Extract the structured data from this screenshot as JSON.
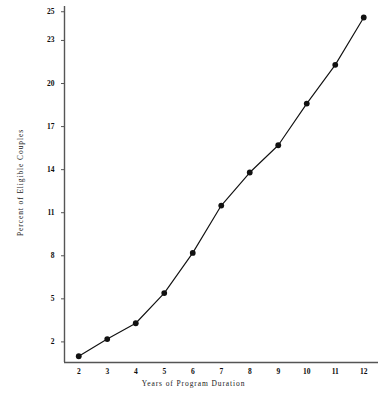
{
  "chart_data": {
    "type": "line",
    "title": "",
    "xlabel": "Years of Program Duration",
    "ylabel": "Percent of Eligible Couples",
    "x": [
      2,
      3,
      4,
      5,
      6,
      7,
      8,
      9,
      10,
      11,
      12
    ],
    "values": [
      1.0,
      2.2,
      3.3,
      5.4,
      8.2,
      11.5,
      13.8,
      15.7,
      18.6,
      21.3,
      24.6
    ],
    "series": [
      {
        "name": "Percent of Eligible Couples",
        "values": [
          1.0,
          2.2,
          3.3,
          5.4,
          8.2,
          11.5,
          13.8,
          15.7,
          18.6,
          21.3,
          24.6
        ]
      }
    ],
    "xticks": [
      "2",
      "3",
      "4",
      "5",
      "6",
      "7",
      "8",
      "9",
      "10",
      "11",
      "12"
    ],
    "yticks": [
      "2",
      "5",
      "8",
      "11",
      "14",
      "17",
      "20",
      "23",
      "25"
    ],
    "ytick_values": [
      2,
      5,
      8,
      11,
      14,
      17,
      20,
      23,
      25
    ],
    "xlim": [
      1.5,
      12.5
    ],
    "ylim": [
      0.6,
      25.4
    ],
    "grid": false,
    "legend": false,
    "legend_position": "none",
    "marker": "filled-circle",
    "line_color": "#111111",
    "marker_color": "#111111",
    "axis_color": "#555555",
    "background_color": "#ffffff"
  }
}
